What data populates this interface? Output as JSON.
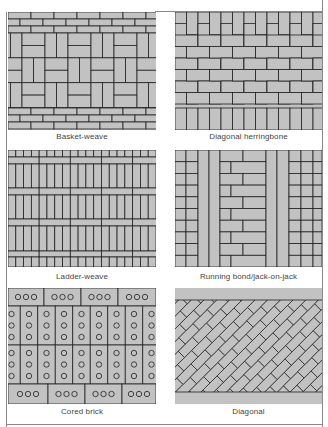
{
  "colors": {
    "brick": "#c2c2c2",
    "mortar": "#222222",
    "frame": "#888888",
    "background": "#ffffff"
  },
  "panels": [
    {
      "id": "basket-weave",
      "caption": "Basket-weave"
    },
    {
      "id": "diagonal-herringbone",
      "caption": "Diagonal herringbone"
    },
    {
      "id": "ladder-weave",
      "caption": "Ladder-weave"
    },
    {
      "id": "running-bond-jack-on-jack",
      "caption": "Running bond/jack-on-jack"
    },
    {
      "id": "cored-brick",
      "caption": "Cored brick"
    },
    {
      "id": "diagonal",
      "caption": "Diagonal"
    }
  ]
}
